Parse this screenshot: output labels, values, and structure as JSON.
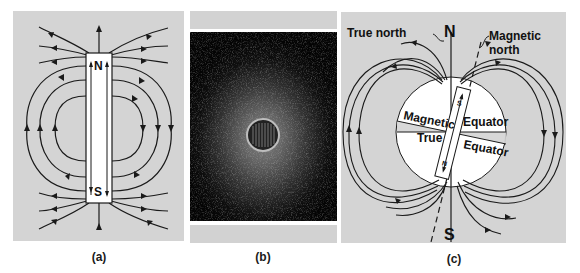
{
  "figure": {
    "panels": [
      {
        "id": "a",
        "caption": "(a)",
        "description": "Field lines around a bar magnet",
        "labels": {
          "north_pole": "N",
          "south_pole": "S"
        }
      },
      {
        "id": "b",
        "caption": "(b)",
        "description": "Iron filings pattern around a magnet viewed end-on"
      },
      {
        "id": "c",
        "caption": "(c)",
        "description": "Earth's magnetic field modeled as a tilted bar magnet",
        "labels": {
          "true_north": "True north",
          "geo_north": "N",
          "geo_south": "S",
          "magnetic_north_line1": "Magnetic",
          "magnetic_north_line2": "north",
          "magnetic_equator_word1": "Magnetic",
          "magnetic_equator_word2": "Equator",
          "true_equator_word1": "True",
          "true_equator_word2": "Equator",
          "bar_north": "N",
          "bar_south": "S"
        }
      }
    ],
    "colors": {
      "panel_bg": "#d3d3d3",
      "line": "#1a1a1a",
      "globe": "#ffffff",
      "filings_bg": "#050505"
    }
  }
}
